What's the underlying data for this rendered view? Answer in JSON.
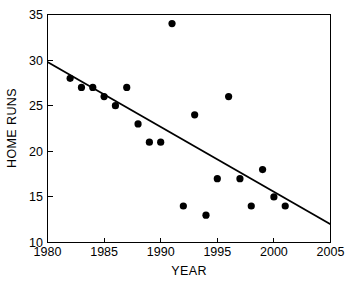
{
  "chart_data": {
    "type": "scatter",
    "title": "",
    "xlabel": "YEAR",
    "ylabel": "HOME RUNS",
    "xlim": [
      1980,
      2005
    ],
    "ylim": [
      10,
      35
    ],
    "xticks": [
      1980,
      1985,
      1990,
      1995,
      2000,
      2005
    ],
    "xtick_labels": [
      "1980",
      "1985",
      "1990",
      "1995",
      "2000",
      "2005"
    ],
    "yticks": [
      10,
      15,
      20,
      25,
      30,
      35
    ],
    "ytick_labels": [
      "10",
      "15",
      "20",
      "25",
      "30",
      "35"
    ],
    "grid": false,
    "legend": false,
    "marker": "filled-circle",
    "marker_color": "#000000",
    "points": [
      {
        "x": 1982,
        "y": 28
      },
      {
        "x": 1983,
        "y": 27
      },
      {
        "x": 1984,
        "y": 27
      },
      {
        "x": 1985,
        "y": 26
      },
      {
        "x": 1986,
        "y": 25
      },
      {
        "x": 1987,
        "y": 27
      },
      {
        "x": 1988,
        "y": 23
      },
      {
        "x": 1989,
        "y": 21
      },
      {
        "x": 1990,
        "y": 21
      },
      {
        "x": 1991,
        "y": 34
      },
      {
        "x": 1992,
        "y": 14
      },
      {
        "x": 1993,
        "y": 24
      },
      {
        "x": 1994,
        "y": 13
      },
      {
        "x": 1995,
        "y": 17
      },
      {
        "x": 1996,
        "y": 26
      },
      {
        "x": 1997,
        "y": 17
      },
      {
        "x": 1998,
        "y": 14
      },
      {
        "x": 1999,
        "y": 18
      },
      {
        "x": 2000,
        "y": 15
      },
      {
        "x": 2001,
        "y": 14
      }
    ],
    "trend_line": {
      "type": "linear-fit",
      "x_start": 1980,
      "y_start": 29.8,
      "x_end": 2005,
      "y_end": 12.0,
      "color": "#000000"
    }
  },
  "axes": {
    "x_title": "YEAR",
    "y_title": "HOME RUNS"
  }
}
